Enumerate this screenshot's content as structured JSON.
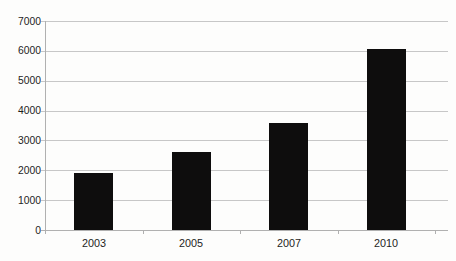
{
  "chart_data": {
    "type": "bar",
    "categories": [
      "2003",
      "2005",
      "2007",
      "2010"
    ],
    "values": [
      1900,
      2600,
      3600,
      6050
    ],
    "title": "",
    "xlabel": "",
    "ylabel": "",
    "ylim": [
      0,
      7000
    ],
    "ytick_step": 1000,
    "ytick_labels": [
      "0",
      "1000",
      "2000",
      "3000",
      "4000",
      "5000",
      "6000",
      "7000"
    ],
    "grid": "horizontal",
    "legend": "none"
  },
  "colors": {
    "bar": "#0e0d0d",
    "gridline": "#c7c7c7",
    "axis": "#b0b0b0",
    "text": "#1e1e1e",
    "background": "#fdfdfc"
  }
}
